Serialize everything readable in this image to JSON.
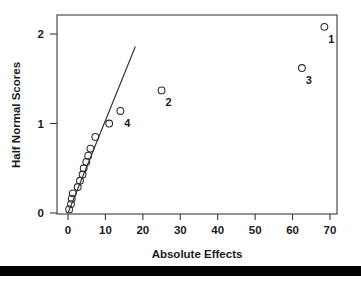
{
  "chart_data": {
    "type": "scatter",
    "title": "",
    "xlabel": "Absolute Effects",
    "ylabel": "Half Normal Scores",
    "xlim": [
      -2,
      72
    ],
    "ylim": [
      -0.06,
      2.2
    ],
    "xticks": [
      0,
      10,
      20,
      30,
      40,
      50,
      60,
      70
    ],
    "xticklabels": [
      "0",
      "10",
      "20",
      "30",
      "40",
      "50",
      "60",
      "70"
    ],
    "yticks": [
      0,
      1,
      2
    ],
    "yticklabels": [
      "0",
      "1",
      "2"
    ],
    "grid": false,
    "legend": false,
    "marker": "open-circle",
    "points": [
      {
        "x": 0.3,
        "y": 0.04,
        "label": ""
      },
      {
        "x": 0.8,
        "y": 0.1,
        "label": ""
      },
      {
        "x": 1.0,
        "y": 0.16,
        "label": ""
      },
      {
        "x": 1.3,
        "y": 0.22,
        "label": ""
      },
      {
        "x": 2.6,
        "y": 0.29,
        "label": ""
      },
      {
        "x": 3.2,
        "y": 0.36,
        "label": ""
      },
      {
        "x": 3.9,
        "y": 0.43,
        "label": ""
      },
      {
        "x": 4.2,
        "y": 0.5,
        "label": ""
      },
      {
        "x": 4.9,
        "y": 0.57,
        "label": ""
      },
      {
        "x": 5.4,
        "y": 0.64,
        "label": ""
      },
      {
        "x": 6.0,
        "y": 0.72,
        "label": ""
      },
      {
        "x": 7.3,
        "y": 0.85,
        "label": ""
      },
      {
        "x": 11.0,
        "y": 1.0,
        "label": ""
      },
      {
        "x": 14.0,
        "y": 1.14,
        "label": "4"
      },
      {
        "x": 25.0,
        "y": 1.37,
        "label": "2"
      },
      {
        "x": 62.5,
        "y": 1.62,
        "label": "3"
      },
      {
        "x": 68.5,
        "y": 2.08,
        "label": "1"
      }
    ],
    "reference_line": {
      "x0": 0.0,
      "y0": 0.0,
      "x1": 18.0,
      "y1": 1.86
    },
    "colors": {
      "axis": "#3a3a3a",
      "marker_stroke": "#2b2b2b",
      "line": "#2b2b2b",
      "text": "#1a1a1a",
      "background": "#ffffff",
      "footer_bar": "#000000"
    }
  }
}
